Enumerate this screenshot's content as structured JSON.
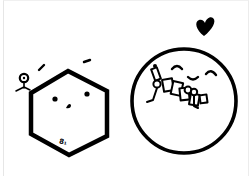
{
  "illustration": {
    "background": "#ffffff",
    "stroke_color": "#000000",
    "hexagon_character": {
      "shape": "hexagon",
      "face": [
        "left-eye-dot",
        "right-eye-dot",
        "nose-mark"
      ],
      "label": "8₁",
      "accessories": [
        "small-stick-figure",
        "eyebrow-dashes"
      ]
    },
    "circle_character": {
      "shape": "circle",
      "face": [
        "closed-happy-eyes",
        "smile"
      ],
      "accessories": [
        "tangle-of-figures-and-boxes",
        "heart"
      ]
    }
  }
}
